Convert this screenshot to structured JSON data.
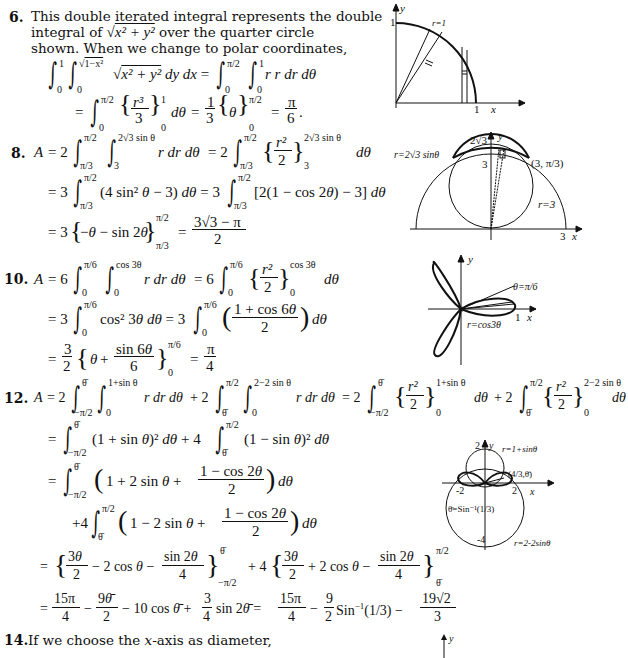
{
  "problems": [
    {
      "number": "6.",
      "intro_lines": [
        "This double iterated integral represents the double",
        "integral of √(x² + y²) over the quarter circle",
        "shown. When we change to polar coordinates,"
      ],
      "equations": [
        "∫₀¹ ∫₀^√(1−x²) √(x² + y²) dy dx = ∫₀^(π/2) ∫₀¹ r r dr dθ",
        "= ∫₀^(π/2) {r³/3}₀¹ dθ = (1/3){θ}₀^(π/2) = π/6."
      ],
      "figure": {
        "labels": [
          "y",
          "r=1",
          "1",
          "1",
          "x"
        ]
      }
    },
    {
      "number": "8.",
      "equations": [
        "A = 2 ∫_(π/3)^(π/2) ∫_3^(2√3 sin θ) r dr dθ = 2 ∫_(π/3)^(π/2) {r²/2}_3^(2√3 sin θ) dθ",
        "= 3 ∫_(π/3)^(π/2) (4 sin² θ − 3) dθ = 3 ∫_(π/3)^(π/2) [2(1 − cos 2θ) − 3] dθ",
        "= 3{−θ − sin 2θ}_(π/3)^(π/2) = (3√3 − π)/2"
      ],
      "figure": {
        "labels": [
          "2√3",
          "y",
          "r=2√3 sinθ",
          "3",
          "(3, π/3)",
          "r=3",
          "3",
          "x"
        ]
      }
    },
    {
      "number": "10.",
      "equations": [
        "A = 6 ∫₀^(π/6) ∫₀^(cos 3θ) r dr dθ = 6 ∫₀^(π/6) {r²/2}₀^(cos 3θ) dθ",
        "= 3 ∫₀^(π/6) cos² 3θ dθ = 3 ∫₀^(π/6) ((1 + cos 6θ)/2) dθ",
        "= (3/2) {θ + (sin 6θ)/6}₀^(π/6) = π/4"
      ],
      "figure": {
        "labels": [
          "y",
          "θ=π/6",
          "1",
          "x",
          "r=cos3θ"
        ]
      }
    },
    {
      "number": "12.",
      "equations": [
        "A = 2 ∫_(−π/2)^θ̄ ∫₀^(1+sin θ) r dr dθ + 2 ∫_θ̄^(π/2) ∫₀^(2−2 sin θ) r dr dθ = 2 ∫_(−π/2)^θ̄ {r²/2}₀^(1+sin θ) dθ + 2 ∫_θ̄^(π/2) {r²/2}₀^(2−2 sin θ) dθ",
        "= ∫_(−π/2)^θ̄ (1 + sin θ)² dθ + 4 ∫_θ̄^(π/2) (1 − sin θ)² dθ",
        "= ∫_(−π/2)^θ̄ (1 + 2 sin θ + (1 − cos 2θ)/2) dθ",
        "+4 ∫_θ̄^(π/2) (1 − 2 sin θ + (1 − cos 2θ)/2) dθ",
        "= {3θ/2 − 2 cos θ − (sin 2θ)/4}_(−π/2)^θ̄ + 4 {3θ/2 + 2 cos θ − (sin 2θ)/4}_θ̄^(π/2)",
        "= 15π/4 − 9θ̄/2 − 10 cos θ̄ + (3/4) sin 2θ̄ = 15π/4 − (9/2)Sin⁻¹(1/3) − 19√2/3"
      ],
      "figure": {
        "labels": [
          "2",
          "y",
          "r=1+sinθ",
          "(4/3,θ̄)",
          "-2",
          "2",
          "x",
          "θ̄=Sin⁻¹(1/3)",
          "-4",
          "r=2-2sinθ"
        ]
      }
    },
    {
      "number": "14.",
      "intro_lines": [
        "If we choose the x-axis as diameter,"
      ],
      "figure": {
        "labels": [
          "y"
        ]
      }
    }
  ]
}
